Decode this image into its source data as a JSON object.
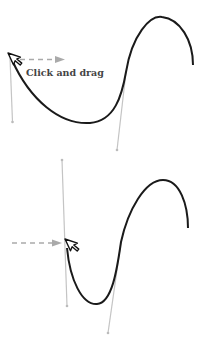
{
  "diagram": {
    "annotation": "Click and drag",
    "colors": {
      "curve": "#1a1a1a",
      "handle": "#bbbbbb",
      "arrow": "#aaaaaa",
      "text": "#444444"
    },
    "figures": [
      {
        "id": "top",
        "description": "Dragging from anchor point to create a smooth curve",
        "anchor": [
          10,
          55
        ],
        "handle_end": [
          12,
          122
        ],
        "second_anchor": [
          125,
          78
        ],
        "second_handle_end": [
          117,
          150
        ]
      },
      {
        "id": "bottom",
        "description": "Anchor point with extended handle after dragging",
        "anchor": [
          66,
          240
        ],
        "handle_start": [
          62,
          160
        ],
        "handle_end": [
          67,
          306
        ],
        "second_anchor": [
          121,
          242
        ],
        "second_handle_end": [
          108,
          333
        ]
      }
    ]
  }
}
